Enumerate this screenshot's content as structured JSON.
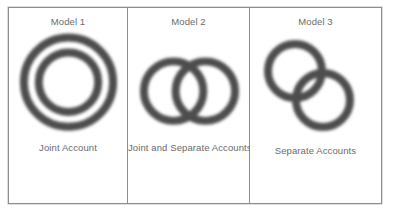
{
  "figure": {
    "type": "venn-style concentric and overlapping ring diagram",
    "frame_color": "#8e8e8e",
    "background_color": "#ffffff",
    "ring_color": "#4e4e4e",
    "text_color": "#6a6a6a",
    "panels": [
      {
        "id": "model-1",
        "title": "Model 1",
        "caption": "Joint Account",
        "arrangement": "concentric",
        "rings": [
          {
            "name": "outer-ring",
            "cx": 60,
            "cy": 74,
            "r": 45,
            "stroke_width": 8
          },
          {
            "name": "inner-ring",
            "cx": 60,
            "cy": 74,
            "r": 30,
            "stroke_width": 8
          }
        ]
      },
      {
        "id": "model-2",
        "title": "Model 2",
        "caption": "Joint and Separate Accounts",
        "arrangement": "overlapping-horizontal",
        "rings": [
          {
            "name": "left-ring",
            "cx": 46,
            "cy": 83,
            "r": 30,
            "stroke_width": 8
          },
          {
            "name": "right-ring",
            "cx": 78,
            "cy": 83,
            "r": 30,
            "stroke_width": 8
          }
        ]
      },
      {
        "id": "model-3",
        "title": "Model 3",
        "caption": "Separate Accounts",
        "arrangement": "overlapping-diagonal",
        "rings": [
          {
            "name": "upper-left-ring",
            "cx": 45,
            "cy": 63,
            "r": 27,
            "stroke_width": 8
          },
          {
            "name": "lower-right-ring",
            "cx": 73,
            "cy": 92,
            "r": 27,
            "stroke_width": 8
          }
        ]
      }
    ]
  }
}
